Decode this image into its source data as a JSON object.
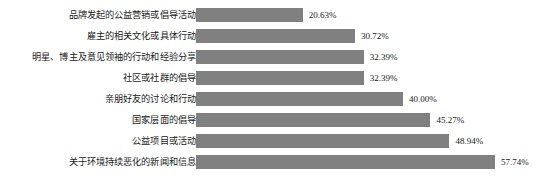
{
  "chart_data": {
    "type": "bar",
    "orientation": "horizontal",
    "title": "",
    "subtitle": "",
    "xlabel": "",
    "ylabel": "",
    "grid": false,
    "legend": false,
    "legend_position": "none",
    "axis_visible": false,
    "tick_labels": [],
    "xlim": [
      0,
      57.74
    ],
    "value_suffix": "%",
    "bar_color": "#808080",
    "background_color": "#ffffff",
    "text_color": "#1a1a1a",
    "categories": [
      "品牌发起的公益营销或倡导活动",
      "雇主的相关文化或具体行动",
      "明星、博主及意见领袖的行动和经验分享",
      "社区或社群的倡导",
      "亲朋好友的讨论和行动",
      "国家层面的倡导",
      "公益项目或活动",
      "关于环境持续恶化的新闻和信息"
    ],
    "values": [
      20.63,
      30.72,
      32.39,
      32.39,
      40.0,
      45.27,
      48.94,
      57.74
    ],
    "value_labels": [
      "20.63%",
      "30.72%",
      "32.39%",
      "32.39%",
      "40.00%",
      "45.27%",
      "48.94%",
      "57.74%"
    ]
  }
}
